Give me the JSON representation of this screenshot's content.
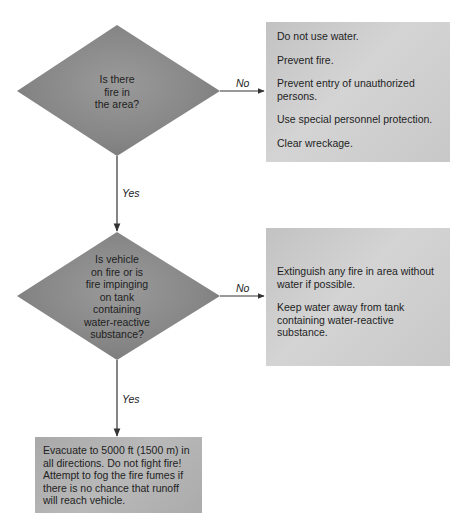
{
  "flowchart": {
    "decisions": [
      {
        "id": "decision-1",
        "lines": [
          "Is there",
          "fire in",
          "the area?"
        ],
        "text": "Is there fire in the area?"
      },
      {
        "id": "decision-2",
        "lines": [
          "Is vehicle",
          "on fire or is",
          "fire impinging",
          "on tank",
          "containing",
          "water-reactive",
          "substance?"
        ],
        "text": "Is vehicle on fire or is fire impinging on tank containing water-reactive substance?"
      }
    ],
    "actions": [
      {
        "id": "action-1",
        "items": [
          "Do not use water.",
          "Prevent fire.",
          "Prevent entry of unauthorized persons.",
          "Use special personnel protection.",
          "Clear wreckage."
        ]
      },
      {
        "id": "action-2",
        "items": [
          "Extinguish any fire in area without water if possible.",
          "Keep water away from tank containing water-reactive substance."
        ]
      },
      {
        "id": "action-3",
        "items": [
          "Evacuate to 5000 ft (1500 m) in all directions. Do not fight fire! Attempt to fog the fire fumes if there is no chance that runoff will reach vehicle."
        ]
      }
    ],
    "edges": [
      {
        "from": "decision-1",
        "to": "action-1",
        "label": "No"
      },
      {
        "from": "decision-1",
        "to": "decision-2",
        "label": "Yes"
      },
      {
        "from": "decision-2",
        "to": "action-2",
        "label": "No"
      },
      {
        "from": "decision-2",
        "to": "action-3",
        "label": "Yes"
      }
    ],
    "colors": {
      "diamond_fill": "#8a8a8a",
      "light_box_fill": "#cfcfcf",
      "dark_box_fill": "#b0b0b0",
      "line": "#333333"
    }
  }
}
